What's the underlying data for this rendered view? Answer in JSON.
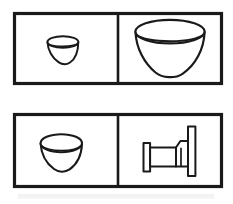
{
  "figure": {
    "title": "Object line drawings comparison grid",
    "background_color": "#ffffff",
    "ink_color": "#1a1a1a",
    "canvas": {
      "width": 233,
      "height": 204
    },
    "panels": [
      {
        "id": "top-panel",
        "label": "Top panel",
        "frame": {
          "x": 14,
          "y": 13,
          "width": 208,
          "height": 71
        },
        "divider_x": 118,
        "cells": [
          {
            "id": "top-left-cell",
            "label": "Top left cell",
            "object_name": "small-bowl",
            "object_label": "Small bowl",
            "description": "Small bowl seen slightly from above with elliptical rim",
            "bounds": {
              "x": 47,
              "y": 36,
              "width": 31,
              "height": 30
            }
          },
          {
            "id": "top-right-cell",
            "label": "Top right cell",
            "object_name": "large-bowl",
            "object_label": "Large bowl",
            "description": "Large bowl seen slightly from above with wide elliptical rim",
            "bounds": {
              "x": 135,
              "y": 20,
              "width": 70,
              "height": 58
            }
          }
        ]
      },
      {
        "id": "bottom-panel",
        "label": "Bottom panel",
        "frame": {
          "x": 14,
          "y": 114,
          "width": 208,
          "height": 73
        },
        "divider_x": 118,
        "cells": [
          {
            "id": "bottom-left-cell",
            "label": "Bottom left cell",
            "object_name": "medium-bowl",
            "object_label": "Bowl",
            "description": "Bowl seen from above with elliptical rim",
            "bounds": {
              "x": 40,
              "y": 133,
              "width": 42,
              "height": 39
            }
          },
          {
            "id": "bottom-right-cell",
            "label": "Bottom right cell",
            "object_name": "bed",
            "object_label": "Bed",
            "description": "Bed in side view with low footboard at left and tall headboard at right",
            "bounds": {
              "x": 143,
              "y": 126,
              "width": 57,
              "height": 50
            }
          }
        ]
      }
    ],
    "artifact": {
      "name": "scan-smudge",
      "label": "Faint scan smudge along lower edge",
      "bounds": {
        "x": 18,
        "y": 194,
        "width": 196,
        "height": 5
      }
    }
  }
}
